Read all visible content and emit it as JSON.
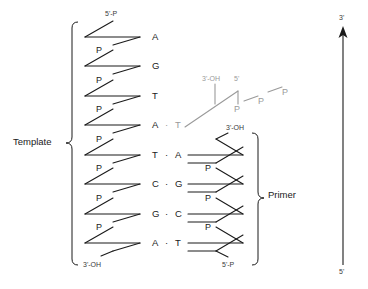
{
  "diagram": {
    "type": "dna-replication-schematic",
    "colors": {
      "stroke": "#1a1a1a",
      "faint": "#9a9a9a",
      "text": "#1a1a1a",
      "background": "#ffffff"
    }
  },
  "template": {
    "label": "Template",
    "five_prime_label": "5'-P",
    "three_prime_label": "3'-OH",
    "phosphate_label": "P",
    "phosphate_count": 7,
    "bases": [
      "A",
      "G",
      "T",
      "A",
      "T",
      "C",
      "G",
      "A"
    ]
  },
  "primer": {
    "label": "Primer",
    "three_prime_label": "3'-OH",
    "five_prime_label": "5'-P",
    "phosphate_label": "P",
    "phosphate_count": 3,
    "bases": [
      "A",
      "G",
      "C",
      "T"
    ]
  },
  "pairs": [
    {
      "template": "A",
      "primer": "",
      "paired": false,
      "incoming": false
    },
    {
      "template": "G",
      "primer": "",
      "paired": false,
      "incoming": false
    },
    {
      "template": "T",
      "primer": "",
      "paired": false,
      "incoming": false
    },
    {
      "template": "A",
      "primer": "T",
      "paired": true,
      "incoming": true
    },
    {
      "template": "T",
      "primer": "A",
      "paired": true,
      "incoming": false
    },
    {
      "template": "C",
      "primer": "G",
      "paired": true,
      "incoming": false
    },
    {
      "template": "G",
      "primer": "C",
      "paired": true,
      "incoming": false
    },
    {
      "template": "A",
      "primer": "T",
      "paired": true,
      "incoming": false
    }
  ],
  "pair_dot": "·",
  "incoming_nucleotide": {
    "three_prime_label": "3'-OH",
    "five_prime_label": "5'",
    "phosphates": [
      "P",
      "P",
      "P"
    ],
    "bond_dash": "—"
  },
  "direction_arrow": {
    "top_label": "3'",
    "bottom_label": "5'"
  }
}
